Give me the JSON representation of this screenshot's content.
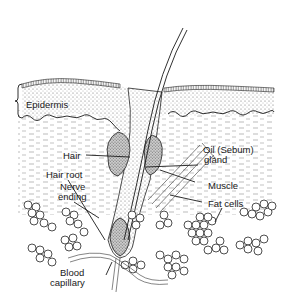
{
  "diagram": {
    "colors": {
      "ink": "#1a1a1a",
      "background": "#ffffff",
      "stipple": "#8a8a8a"
    },
    "labels": {
      "epidermis": "Epidermis",
      "hair": "Hair",
      "hair_root": "Hair root",
      "nerve_line1": "Nerve",
      "nerve_line2": "ending",
      "oil_line1": "Oil (Sebum)",
      "oil_line2": "gland",
      "muscle": "Muscle",
      "fat_cells": "Fat cells",
      "blood_line1": "Blood",
      "blood_line2": "capillary"
    }
  }
}
